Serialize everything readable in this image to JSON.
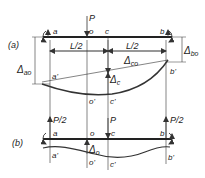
{
  "figure": {
    "part_a": {
      "label": "(a)",
      "load": "P",
      "points": {
        "a": "a",
        "o": "o",
        "c": "c",
        "b": "b"
      },
      "deflected_points": {
        "a": "a'",
        "o": "o'",
        "c": "c'",
        "b": "b'"
      },
      "dims": {
        "left_half": "L/2",
        "right_half": "L/2"
      },
      "deltas": {
        "ao": "Δ",
        "ao_sub": "ao",
        "bo": "Δ",
        "bo_sub": "bo",
        "co": "Δ",
        "co_sub": "co",
        "c": "Δ",
        "c_sub": "c"
      }
    },
    "part_b": {
      "label": "(b)",
      "loads": {
        "left": "P/2",
        "center": "P",
        "right": "P/2"
      },
      "points": {
        "a": "a",
        "o": "o",
        "c": "c",
        "b": "b"
      },
      "deflected_points": {
        "a": "a'",
        "o": "o'",
        "c": "c'",
        "b": "b'"
      },
      "deltas": {
        "o": "Δ",
        "o_sub": "o"
      }
    }
  }
}
